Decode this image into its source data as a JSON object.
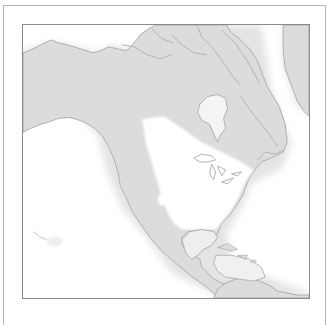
{
  "map": {
    "region": "North America",
    "projection_view": "Polar/azimuthal view centered on North America",
    "colors": {
      "land": "#dcdcdc",
      "coastline": "#a8a8a8",
      "water": "#ffffff",
      "highlight": "#ffffff",
      "frame": "#8a8a8a",
      "outer_frame": "#b5b5b5"
    },
    "features": [
      {
        "name": "Alaska"
      },
      {
        "name": "Canada"
      },
      {
        "name": "Hudson Bay"
      },
      {
        "name": "Greenland"
      },
      {
        "name": "Great Lakes"
      },
      {
        "name": "United States"
      },
      {
        "name": "Mexico"
      },
      {
        "name": "Gulf of Mexico"
      },
      {
        "name": "Caribbean Islands"
      },
      {
        "name": "Central America"
      },
      {
        "name": "South America (north)"
      },
      {
        "name": "Hawaii"
      }
    ]
  }
}
